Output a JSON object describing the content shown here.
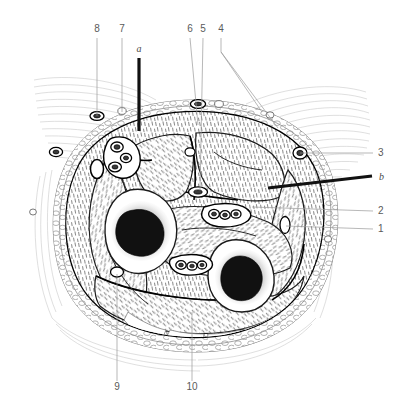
{
  "figure": {
    "style": "black-and-white line engraving",
    "background_color": "#ffffff",
    "ink_color": "#000000",
    "muscle_fiber_color": "#8d8d8d",
    "leader_color": "#9a9a9a",
    "label_color": "#5a5a5a"
  },
  "labels": {
    "top": [
      {
        "id": "8",
        "text": "8",
        "x": 97,
        "y": 32,
        "leader_from_x": 97,
        "leader_from_y": 38,
        "leader_to_x": 97,
        "leader_to_y": 116,
        "style": "numeric"
      },
      {
        "id": "7",
        "text": "7",
        "x": 122,
        "y": 32,
        "leader_from_x": 122,
        "leader_from_y": 38,
        "leader_to_x": 122,
        "leader_to_y": 112,
        "style": "numeric"
      },
      {
        "id": "a",
        "text": "a",
        "x": 139,
        "y": 52,
        "leader_from_x": 139,
        "leader_from_y": 58,
        "leader_to_x": 139,
        "leader_to_y": 131,
        "style": "italic-thick"
      },
      {
        "id": "6",
        "text": "6",
        "x": 190,
        "y": 32,
        "leader_from_x": 190,
        "leader_from_y": 38,
        "leader_to_x": 198,
        "leader_to_y": 125,
        "style": "numeric"
      },
      {
        "id": "5",
        "text": "5",
        "x": 203,
        "y": 32,
        "leader_from_x": 203,
        "leader_from_y": 38,
        "leader_to_x": 200,
        "leader_to_y": 190,
        "style": "numeric"
      },
      {
        "id": "4",
        "text": "4",
        "x": 221,
        "y": 32,
        "leader_from_x": 221,
        "leader_from_y": 38,
        "leader_to_x": 221,
        "leader_to_y": 52,
        "style": "numeric-branched"
      }
    ],
    "right": [
      {
        "id": "3",
        "text": "3",
        "x": 378,
        "y": 156,
        "leader_from_x": 373,
        "leader_from_y": 153,
        "leader_to_x": 300,
        "leader_to_y": 153,
        "style": "numeric"
      },
      {
        "id": "b",
        "text": "b",
        "x": 380,
        "y": 179,
        "leader_from_x": 372,
        "leader_from_y": 176,
        "leader_to_x": 268,
        "leader_to_y": 187,
        "style": "italic-thick"
      },
      {
        "id": "2",
        "text": "2",
        "x": 378,
        "y": 214,
        "leader_from_x": 373,
        "leader_from_y": 211,
        "leader_to_x": 252,
        "leader_to_y": 205,
        "style": "numeric"
      },
      {
        "id": "1",
        "text": "1",
        "x": 378,
        "y": 232,
        "leader_from_x": 373,
        "leader_from_y": 229,
        "leader_to_x": 285,
        "leader_to_y": 227,
        "style": "numeric"
      }
    ],
    "bottom": [
      {
        "id": "9",
        "text": "9",
        "x": 117,
        "y": 387,
        "leader_from_x": 117,
        "leader_from_y": 381,
        "leader_to_x": 117,
        "leader_to_y": 272,
        "style": "numeric"
      },
      {
        "id": "10",
        "text": "10",
        "x": 190,
        "y": 387,
        "leader_from_x": 192,
        "leader_from_y": 381,
        "leader_to_x": 192,
        "leader_to_y": 312,
        "style": "numeric"
      }
    ]
  },
  "structures": {
    "bones": [
      {
        "name": "anterior-bone",
        "cx": 143,
        "cy": 232,
        "marrow_cx": 143,
        "marrow_cy": 230
      },
      {
        "name": "posterior-bone",
        "cx": 243,
        "cy": 278,
        "marrow_cx": 245,
        "marrow_cy": 279
      }
    ],
    "compartments": [
      "anterior-compartment",
      "lateral-compartment",
      "deep-posterior-compartment",
      "superficial-posterior-compartment"
    ],
    "neurovascular_bundles": [
      {
        "name": "upper-medial-bundle",
        "cx": 120,
        "cy": 152
      },
      {
        "name": "central-bundle",
        "cx": 219,
        "cy": 215
      },
      {
        "name": "lower-central-bundle",
        "cx": 188,
        "cy": 267
      }
    ]
  }
}
